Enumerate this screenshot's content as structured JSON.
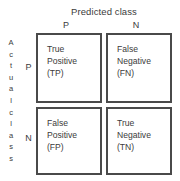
{
  "diagram": {
    "kind": "confusion-matrix",
    "predicted_axis_title": "Predicted class",
    "actual_axis_title": "Actual class",
    "actual_axis_letters": [
      "A",
      "c",
      "t",
      "u",
      "a",
      "l",
      "c",
      "l",
      "a",
      "s",
      "s"
    ],
    "column_headers": [
      "P",
      "N"
    ],
    "row_headers": [
      "P",
      "N"
    ],
    "colors": {
      "border": "#4a4a4a",
      "text": "#3b3b3b",
      "background": "#ffffff"
    },
    "cells": {
      "tp": {
        "line1": "True",
        "line2": "Positive",
        "line3": "(TP)"
      },
      "fn": {
        "line1": "False",
        "line2": "Negative",
        "line3": "(FN)"
      },
      "fp": {
        "line1": "False",
        "line2": "Positive",
        "line3": "(FP)"
      },
      "tn": {
        "line1": "True",
        "line2": "Negative",
        "line3": "(TN)"
      }
    }
  }
}
